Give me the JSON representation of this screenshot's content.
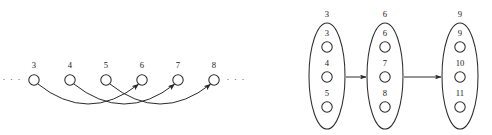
{
  "figure": {
    "background_color": "#ffffff",
    "stroke_color": "#2b2b2b",
    "text_color": "#1a1a1a",
    "left_panel": {
      "ellipsis_left": "· · ·",
      "ellipsis_right": "· · ·",
      "nodes": [
        {
          "label": "3",
          "cx": 34,
          "cy": 80
        },
        {
          "label": "4",
          "cx": 70,
          "cy": 80
        },
        {
          "label": "5",
          "cx": 106,
          "cy": 80
        },
        {
          "label": "6",
          "cx": 142,
          "cy": 80
        },
        {
          "label": "7",
          "cx": 178,
          "cy": 80
        },
        {
          "label": "8",
          "cx": 214,
          "cy": 80
        }
      ],
      "node_radius": 5.2,
      "edges": [
        {
          "from": "3",
          "to": "6",
          "directed": true
        },
        {
          "from": "4",
          "to": "7",
          "directed": true
        },
        {
          "from": "5",
          "to": "8",
          "directed": true
        }
      ]
    },
    "right_panel": {
      "groups": [
        {
          "label": "3",
          "cx": 327,
          "cy": 76,
          "rx": 18,
          "ry": 53,
          "members": [
            {
              "label": "3",
              "cy": 47
            },
            {
              "label": "4",
              "cy": 77
            },
            {
              "label": "5",
              "cy": 107
            }
          ]
        },
        {
          "label": "6",
          "cx": 385,
          "cy": 76,
          "rx": 18,
          "ry": 53,
          "members": [
            {
              "label": "6",
              "cy": 47
            },
            {
              "label": "7",
              "cy": 77
            },
            {
              "label": "8",
              "cy": 107
            }
          ]
        },
        {
          "label": "9",
          "cx": 460,
          "cy": 76,
          "rx": 18,
          "ry": 53,
          "members": [
            {
              "label": "9",
              "cy": 47
            },
            {
              "label": "10",
              "cy": 77
            },
            {
              "label": "11",
              "cy": 107
            }
          ]
        }
      ],
      "member_radius": 5.2,
      "arrows": [
        {
          "from": "3",
          "to": "6",
          "x1": 346,
          "x2": 366,
          "y": 77
        },
        {
          "from": "6",
          "to": "9",
          "x1": 404,
          "x2": 441,
          "y": 77
        }
      ]
    }
  }
}
